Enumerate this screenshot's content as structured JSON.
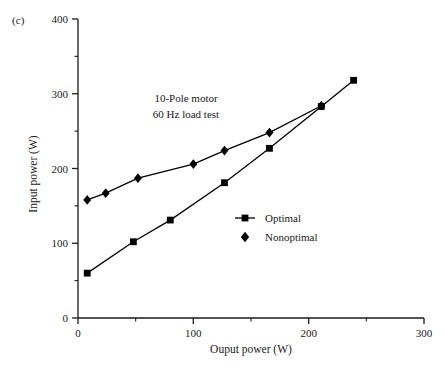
{
  "figure": {
    "panel_label": "(c)"
  },
  "chart_data": {
    "type": "line",
    "title": "",
    "subtitle": "",
    "xlabel": "Ouput power (W)",
    "ylabel": "Input power (W)",
    "xlim": [
      0,
      300
    ],
    "ylim": [
      0,
      400
    ],
    "x_major_ticks": [
      0,
      100,
      200,
      300
    ],
    "x_minor_ticks": [
      50,
      150,
      250
    ],
    "x_tick_labels": [
      "0",
      "100",
      "200",
      "300"
    ],
    "y_major_ticks": [
      0,
      100,
      200,
      300,
      400
    ],
    "y_minor_ticks": [
      50,
      150,
      250,
      350
    ],
    "y_tick_labels": [
      "0",
      "100",
      "200",
      "300",
      "400"
    ],
    "grid": false,
    "legend_position": "center-right",
    "annotations": [
      "10-Pole motor",
      "60 Hz load test"
    ],
    "series": [
      {
        "name": "Optimal",
        "marker": "square",
        "color": "#000000",
        "points": [
          {
            "x": 8,
            "y": 60
          },
          {
            "x": 48,
            "y": 102
          },
          {
            "x": 80,
            "y": 131
          },
          {
            "x": 127,
            "y": 181
          },
          {
            "x": 166,
            "y": 227
          },
          {
            "x": 211,
            "y": 283
          },
          {
            "x": 239,
            "y": 318
          }
        ]
      },
      {
        "name": "Nonoptimal",
        "marker": "diamond",
        "color": "#000000",
        "points": [
          {
            "x": 8,
            "y": 158
          },
          {
            "x": 24,
            "y": 167
          },
          {
            "x": 52,
            "y": 187
          },
          {
            "x": 100,
            "y": 206
          },
          {
            "x": 127,
            "y": 224
          },
          {
            "x": 166,
            "y": 248
          },
          {
            "x": 211,
            "y": 284
          }
        ]
      }
    ]
  },
  "legend": {
    "items": [
      {
        "label": "Optimal",
        "marker": "square"
      },
      {
        "label": "Nonoptimal",
        "marker": "diamond"
      }
    ]
  }
}
